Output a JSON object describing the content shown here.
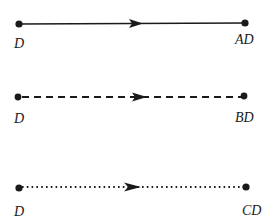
{
  "diagram": {
    "stroke_color": "#1a1a1a",
    "arrows": [
      {
        "style": "solid",
        "source_label": "D",
        "target_label": "AD",
        "y": 24,
        "x1": 19,
        "x2": 245,
        "arrowhead_x": 143,
        "source_label_pos": {
          "x": 14,
          "y": 37
        },
        "target_label_pos": {
          "x": 235,
          "y": 33
        }
      },
      {
        "style": "dashed",
        "source_label": "D",
        "target_label": "BD",
        "y": 97,
        "x1": 18,
        "x2": 244,
        "arrowhead_x": 146,
        "source_label_pos": {
          "x": 14,
          "y": 112
        },
        "target_label_pos": {
          "x": 235,
          "y": 111
        }
      },
      {
        "style": "dotted",
        "source_label": "D",
        "target_label": "CD",
        "y": 187,
        "x1": 19,
        "x2": 246,
        "arrowhead_x": 140,
        "source_label_pos": {
          "x": 14,
          "y": 205
        },
        "target_label_pos": {
          "x": 242,
          "y": 204
        }
      }
    ]
  }
}
